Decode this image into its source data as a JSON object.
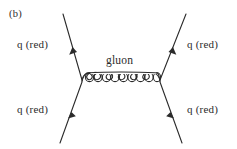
{
  "figure": {
    "panel_label": "(b)",
    "type": "feynman-diagram",
    "background_color": "#ffffff",
    "line_color": "#2b2b2b",
    "text_color": "#2b2b2b"
  },
  "labels": {
    "q_upper_left": "q (red)",
    "q_lower_left": "q (red)",
    "q_upper_right": "q (red)",
    "q_lower_right": "q (red)",
    "gluon": "gluon"
  },
  "geometry": {
    "vertex_left": {
      "x": 82,
      "y": 81
    },
    "vertex_right": {
      "x": 160,
      "y": 81
    },
    "gluon_loops": 9,
    "gluon_loop_radius": 4.2,
    "fermion_lines": [
      {
        "name": "incoming-lower-left",
        "x1": 60,
        "y1": 143,
        "x2": 82,
        "y2": 82,
        "arrow_t": 0.52,
        "arrow_dir": "up-right"
      },
      {
        "name": "outgoing-upper-left",
        "x1": 82,
        "y1": 80,
        "x2": 63,
        "y2": 14,
        "arrow_t": 0.5,
        "arrow_dir": "up-left"
      },
      {
        "name": "incoming-lower-right",
        "x1": 182,
        "y1": 143,
        "x2": 160,
        "y2": 82,
        "arrow_t": 0.52,
        "arrow_dir": "up-left"
      },
      {
        "name": "outgoing-upper-right",
        "x1": 160,
        "y1": 80,
        "x2": 186,
        "y2": 14,
        "arrow_t": 0.5,
        "arrow_dir": "up-right"
      }
    ]
  }
}
